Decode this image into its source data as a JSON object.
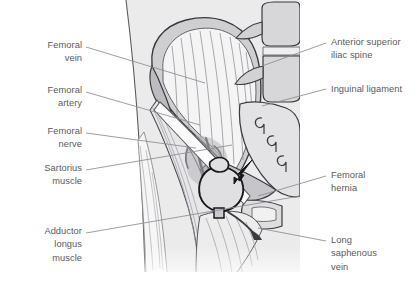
{
  "figure": {
    "kind": "anatomical-illustration",
    "background_color": "#ffffff",
    "label_color": "#5a5a60",
    "leader_line_color": "#8c8c92",
    "outline_color": "#3a3a3e",
    "fill_light": "#f2f2f3",
    "fill_mid": "#dcdcde",
    "fill_dark": "#bcbcc0",
    "fill_panel": "#ebebec"
  },
  "labels": {
    "left": [
      {
        "id": "femoral-vein",
        "lines": [
          "Femoral",
          "vein"
        ]
      },
      {
        "id": "femoral-artery",
        "lines": [
          "Femoral",
          "artery"
        ]
      },
      {
        "id": "femoral-nerve",
        "lines": [
          "Femoral",
          "nerve"
        ]
      },
      {
        "id": "sartorius-muscle",
        "lines": [
          "Sartorius",
          "muscle"
        ]
      },
      {
        "id": "adductor-longus-muscle",
        "lines": [
          "Adductor",
          "longus",
          "muscle"
        ]
      }
    ],
    "right": [
      {
        "id": "anterior-superior-iliac-spine",
        "lines": [
          "Anterior superior",
          "iliac spine"
        ]
      },
      {
        "id": "inguinal-ligament",
        "lines": [
          "Inguinal ligament"
        ]
      },
      {
        "id": "femoral-hernia",
        "lines": [
          "Femoral",
          "hernia"
        ]
      },
      {
        "id": "long-saphenous-vein",
        "lines": [
          "Long",
          "saphenous",
          "vein"
        ]
      }
    ]
  },
  "annotations": {
    "hernia_arrow": "arrow pointing down-left at the femoral hernia sac"
  }
}
